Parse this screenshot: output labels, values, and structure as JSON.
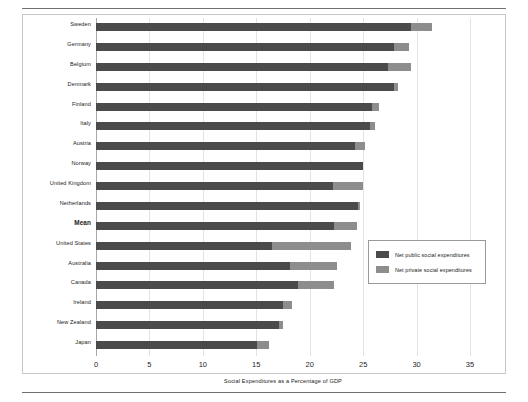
{
  "figure": {
    "x_axis_title": "Social Expenditures as a Percentage of GDP"
  },
  "legend": {
    "items": [
      {
        "label": "Net public social expenditures",
        "color": "#4b4b4b",
        "key": "public"
      },
      {
        "label": "Net private social expenditures",
        "color": "#8d8d8d",
        "key": "private"
      }
    ]
  },
  "axis": {
    "ticks": [
      "0",
      "5",
      "10",
      "15",
      "20",
      "25",
      "30",
      "35"
    ]
  },
  "chart_data": {
    "type": "bar",
    "orientation": "horizontal",
    "stacked": true,
    "title": "",
    "xlabel": "Social Expenditures as a Percentage of GDP",
    "ylabel": "",
    "xlim": [
      0,
      35
    ],
    "xticks": [
      0,
      5,
      10,
      15,
      20,
      25,
      30,
      35
    ],
    "grid": true,
    "legend_position": "right-middle",
    "categories": [
      "Sweden",
      "Germany",
      "Belgium",
      "Denmark",
      "Finland",
      "Italy",
      "Austria",
      "Norway",
      "United Kingdom",
      "Netherlands",
      "Mean",
      "United States",
      "Australia",
      "Canada",
      "Ireland",
      "New Zealand",
      "Japan"
    ],
    "emphasized_categories": [
      "Mean"
    ],
    "series": [
      {
        "name": "Net public social expenditures",
        "color": "#4b4b4b",
        "values": [
          29.5,
          27.9,
          27.3,
          27.9,
          25.8,
          25.6,
          24.2,
          25.0,
          22.2,
          24.5,
          22.3,
          16.5,
          18.2,
          18.9,
          17.5,
          17.1,
          15.1
        ]
      },
      {
        "name": "Net private social expenditures",
        "color": "#8d8d8d",
        "values": [
          1.9,
          1.4,
          2.2,
          0.4,
          0.7,
          0.5,
          1.0,
          0.0,
          2.8,
          0.2,
          2.1,
          7.4,
          4.4,
          3.4,
          0.8,
          0.4,
          1.1
        ]
      }
    ],
    "totals": [
      31.4,
      29.3,
      29.5,
      28.3,
      26.5,
      26.1,
      25.2,
      25.0,
      25.0,
      24.7,
      24.4,
      23.9,
      22.6,
      22.3,
      18.3,
      17.5,
      16.2
    ]
  }
}
